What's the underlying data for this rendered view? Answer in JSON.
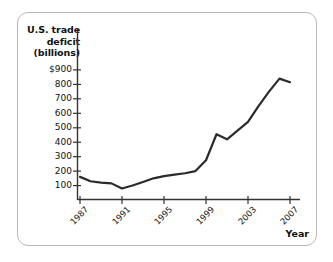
{
  "chart_data": {
    "type": "line",
    "title": "U.S. trade deficit (billions)",
    "title_lines": [
      "U.S. trade",
      "deficit",
      "(billions)"
    ],
    "xlabel": "Year",
    "ylabel": "U.S. trade deficit (billions)",
    "xlim": [
      1987,
      2007
    ],
    "ylim": [
      0,
      950
    ],
    "grid": false,
    "legend": "none",
    "y_tick_labels": [
      "$900",
      "800",
      "700",
      "600",
      "500",
      "400",
      "300",
      "200",
      "100"
    ],
    "y_tick_values": [
      900,
      800,
      700,
      600,
      500,
      400,
      300,
      200,
      100
    ],
    "x_tick_labels": [
      "1987",
      "1991",
      "1995",
      "1999",
      "2003",
      "2007"
    ],
    "x_tick_values": [
      1987,
      1991,
      1995,
      1999,
      2003,
      2007
    ],
    "x": [
      1987,
      1988,
      1989,
      1990,
      1991,
      1992,
      1993,
      1994,
      1995,
      1996,
      1997,
      1998,
      1999,
      2000,
      2001,
      2002,
      2003,
      2004,
      2005,
      2006,
      2007
    ],
    "values": [
      160,
      130,
      120,
      115,
      80,
      100,
      125,
      150,
      165,
      175,
      185,
      200,
      275,
      455,
      420,
      480,
      540,
      650,
      750,
      840,
      815
    ],
    "series": [
      {
        "name": "U.S. trade deficit",
        "color": "#2b2b2b",
        "values": [
          160,
          130,
          120,
          115,
          80,
          100,
          125,
          150,
          165,
          175,
          185,
          200,
          275,
          455,
          420,
          480,
          540,
          650,
          750,
          840,
          815
        ]
      }
    ],
    "line_color": "#2b2b2b",
    "axis_color": "#333333",
    "frame_color": "#b9b9b9"
  }
}
